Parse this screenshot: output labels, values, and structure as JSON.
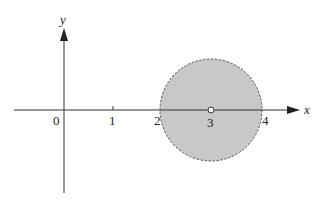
{
  "figure": {
    "axes": {
      "x_label": "x",
      "y_label": "y",
      "origin_label": "0",
      "ticks": [
        {
          "value": 1,
          "label": "1"
        },
        {
          "value": 2,
          "label": "2"
        },
        {
          "value": 3,
          "label": "3"
        },
        {
          "value": 4,
          "label": "4"
        }
      ]
    },
    "region": {
      "shape": "disk",
      "center": [
        3,
        0
      ],
      "radius": 1,
      "boundary": "dashed",
      "fill_color": "#c8c8c8",
      "center_point": "open"
    },
    "colors": {
      "axis": "#333333",
      "fill": "#c8c8c8",
      "boundary": "#555555"
    }
  }
}
